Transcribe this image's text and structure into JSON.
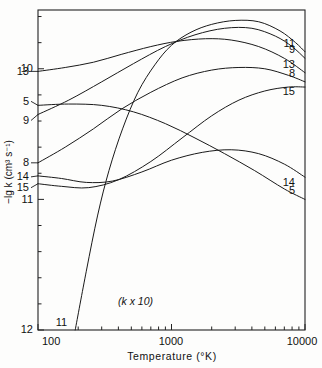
{
  "chart_data": {
    "type": "line",
    "title": "",
    "xlabel": "Temperature (°K)",
    "ylabel": "−lg k (cm³ s⁻¹)",
    "xscale": "log",
    "yscale": "linear",
    "xlim": [
      100,
      10000
    ],
    "ylim_inverted": true,
    "ylim": [
      12,
      9.55
    ],
    "xticks": [
      100,
      1000,
      10000
    ],
    "xtick_labels": [
      "100",
      "1000",
      "10000"
    ],
    "yticks": [
      10,
      11,
      12
    ],
    "ytick_labels": [
      "10",
      "11",
      "12"
    ],
    "grid": false,
    "legend": "inline-curve-labels",
    "annotations": [
      {
        "text": "(k x 10)",
        "x": 330,
        "y": 11.78
      }
    ],
    "series": [
      {
        "name": "13",
        "label_left": "13",
        "label_right": "13",
        "points": [
          [
            100,
            10.02
          ],
          [
            160,
            9.99
          ],
          [
            260,
            9.95
          ],
          [
            420,
            9.89
          ],
          [
            700,
            9.83
          ],
          [
            1100,
            9.79
          ],
          [
            1800,
            9.77
          ],
          [
            2800,
            9.78
          ],
          [
            4500,
            9.83
          ],
          [
            7000,
            9.92
          ],
          [
            10000,
            10.03
          ]
        ]
      },
      {
        "name": "5",
        "label_left": "5",
        "label_right": "5",
        "points": [
          [
            100,
            10.28
          ],
          [
            170,
            10.27
          ],
          [
            300,
            10.28
          ],
          [
            520,
            10.33
          ],
          [
            900,
            10.42
          ],
          [
            1500,
            10.53
          ],
          [
            2500,
            10.65
          ],
          [
            4200,
            10.78
          ],
          [
            7000,
            10.92
          ],
          [
            10000,
            11.0
          ]
        ]
      },
      {
        "name": "9",
        "label_left": "9",
        "label_right": "9",
        "points": [
          [
            100,
            10.35
          ],
          [
            170,
            10.24
          ],
          [
            300,
            10.1
          ],
          [
            520,
            9.96
          ],
          [
            900,
            9.83
          ],
          [
            1500,
            9.74
          ],
          [
            2500,
            9.69
          ],
          [
            4000,
            9.69
          ],
          [
            6000,
            9.75
          ],
          [
            8000,
            9.83
          ],
          [
            10000,
            9.92
          ]
        ]
      },
      {
        "name": "8",
        "label_left": "8",
        "label_right": "8",
        "points": [
          [
            100,
            10.72
          ],
          [
            160,
            10.6
          ],
          [
            260,
            10.46
          ],
          [
            420,
            10.31
          ],
          [
            700,
            10.18
          ],
          [
            1200,
            10.07
          ],
          [
            2000,
            10.01
          ],
          [
            3200,
            9.99
          ],
          [
            5000,
            10.0
          ],
          [
            7500,
            10.05
          ],
          [
            10000,
            10.1
          ]
        ]
      },
      {
        "name": "14",
        "label_left": "14",
        "label_right": "14",
        "points": [
          [
            100,
            10.82
          ],
          [
            150,
            10.84
          ],
          [
            230,
            10.87
          ],
          [
            360,
            10.86
          ],
          [
            600,
            10.79
          ],
          [
            1000,
            10.7
          ],
          [
            1700,
            10.64
          ],
          [
            2800,
            10.62
          ],
          [
            4500,
            10.65
          ],
          [
            7000,
            10.73
          ],
          [
            10000,
            10.83
          ]
        ]
      },
      {
        "name": "15",
        "label_left": "15",
        "label_right": "15",
        "points": [
          [
            100,
            10.88
          ],
          [
            150,
            10.9
          ],
          [
            240,
            10.91
          ],
          [
            400,
            10.85
          ],
          [
            700,
            10.71
          ],
          [
            1200,
            10.53
          ],
          [
            2000,
            10.36
          ],
          [
            3200,
            10.24
          ],
          [
            5000,
            10.17
          ],
          [
            7500,
            10.14
          ],
          [
            10000,
            10.14
          ]
        ]
      },
      {
        "name": "11",
        "label_left": "11",
        "label_right": "11",
        "points": [
          [
            190,
            12.0
          ],
          [
            230,
            11.55
          ],
          [
            280,
            11.12
          ],
          [
            340,
            10.78
          ],
          [
            430,
            10.46
          ],
          [
            560,
            10.18
          ],
          [
            750,
            9.97
          ],
          [
            1000,
            9.82
          ],
          [
            1400,
            9.72
          ],
          [
            2000,
            9.66
          ],
          [
            3000,
            9.63
          ],
          [
            4500,
            9.64
          ],
          [
            6500,
            9.71
          ],
          [
            8500,
            9.8
          ],
          [
            10000,
            9.87
          ]
        ]
      }
    ]
  },
  "labels": {
    "left": [
      {
        "text": "13",
        "series": "13"
      },
      {
        "text": "5",
        "series": "5"
      },
      {
        "text": "9",
        "series": "9"
      },
      {
        "text": "8",
        "series": "8"
      },
      {
        "text": "14",
        "series": "14"
      },
      {
        "text": "15",
        "series": "15"
      },
      {
        "text": "11",
        "series": "11"
      }
    ],
    "right": [
      {
        "text": "11",
        "series": "11"
      },
      {
        "text": "9",
        "series": "9"
      },
      {
        "text": "13",
        "series": "13"
      },
      {
        "text": "8",
        "series": "8"
      },
      {
        "text": "15",
        "series": "15"
      },
      {
        "text": "5",
        "series": "5"
      },
      {
        "text": "14",
        "series": "14"
      }
    ]
  },
  "axes": {
    "x_title": "Temperature (°K)",
    "y_title": "−lg k (cm³ s⁻¹)",
    "x_tick_100": "100",
    "x_tick_1000": "1000",
    "x_tick_10000": "10000",
    "y_tick_10": "10",
    "y_tick_11": "11",
    "y_tick_12": "12"
  },
  "annotation": {
    "k_times_ten": "(k x 10)"
  },
  "style": {
    "line_color": "#1a1a1a",
    "axis_color": "#222222",
    "background": "#fdfdfc"
  }
}
